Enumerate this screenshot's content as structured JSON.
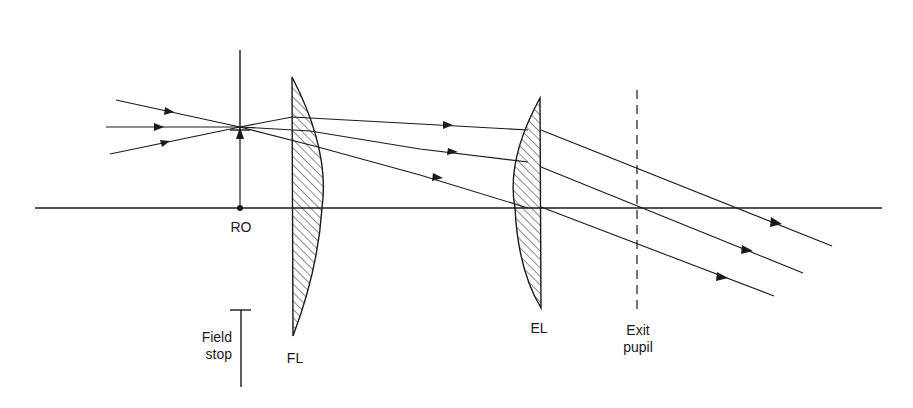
{
  "diagram": {
    "title": "",
    "type": "optical ray diagram (eyepiece)",
    "labels": {
      "ro": "RO",
      "field_stop_line1": "Field",
      "field_stop_line2": "stop",
      "fl": "FL",
      "el": "EL",
      "exit_pupil_line1": "Exit",
      "exit_pupil_line2": "pupil"
    },
    "elements": [
      {
        "id": "optical-axis",
        "kind": "line"
      },
      {
        "id": "real-object",
        "label": "RO",
        "kind": "arrow"
      },
      {
        "id": "field-stop",
        "label": "Field stop",
        "kind": "aperture"
      },
      {
        "id": "field-lens",
        "label": "FL",
        "kind": "plano-convex lens"
      },
      {
        "id": "eye-lens",
        "label": "EL",
        "kind": "plano-convex lens"
      },
      {
        "id": "exit-pupil",
        "label": "Exit pupil",
        "kind": "dashed plane"
      }
    ],
    "rays": 3,
    "colors": {
      "ink": "#1a1a1a",
      "background": "#ffffff"
    }
  }
}
